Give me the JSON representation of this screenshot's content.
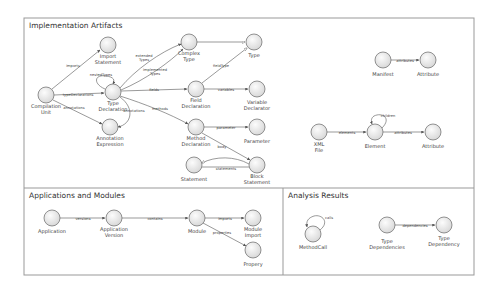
{
  "panels": [
    {
      "id": "impl",
      "title": "Implementation Artifacts",
      "x": 24,
      "y": 18,
      "w": 450,
      "h": 170
    },
    {
      "id": "apps",
      "title": "Applications and Modules",
      "x": 24,
      "y": 188,
      "w": 259,
      "h": 87
    },
    {
      "id": "analysis",
      "title": "Analysis Results",
      "x": 283,
      "y": 188,
      "w": 191,
      "h": 87
    }
  ],
  "nodes": [
    {
      "id": "cu",
      "label": [
        "Compilation",
        "Unit"
      ],
      "x": 46,
      "y": 95
    },
    {
      "id": "is",
      "label": [
        "Import",
        "Statement"
      ],
      "x": 108,
      "y": 45
    },
    {
      "id": "td",
      "label": [
        "Type",
        "Declaration"
      ],
      "x": 113,
      "y": 92
    },
    {
      "id": "ae",
      "label": [
        "Annotation",
        "Expression"
      ],
      "x": 110,
      "y": 127
    },
    {
      "id": "ct",
      "label": [
        "Complex",
        "Type"
      ],
      "x": 189,
      "y": 42
    },
    {
      "id": "ty",
      "label": [
        "Type"
      ],
      "x": 254,
      "y": 42
    },
    {
      "id": "fd",
      "label": [
        "Field",
        "Declaration"
      ],
      "x": 196,
      "y": 89
    },
    {
      "id": "vd",
      "label": [
        "Variable",
        "Declarator"
      ],
      "x": 257,
      "y": 89
    },
    {
      "id": "md",
      "label": [
        "Method",
        "Declaration"
      ],
      "x": 196,
      "y": 127
    },
    {
      "id": "pa",
      "label": [
        "Parameter"
      ],
      "x": 257,
      "y": 127
    },
    {
      "id": "st",
      "label": [
        "Statement"
      ],
      "x": 194,
      "y": 165
    },
    {
      "id": "bs",
      "label": [
        "Block",
        "Statement"
      ],
      "x": 257,
      "y": 165
    },
    {
      "id": "mf",
      "label": [
        "Manifest"
      ],
      "x": 383,
      "y": 60
    },
    {
      "id": "at1",
      "label": [
        "Attribute"
      ],
      "x": 428,
      "y": 60
    },
    {
      "id": "xf",
      "label": [
        "XML",
        "File"
      ],
      "x": 319,
      "y": 132
    },
    {
      "id": "el",
      "label": [
        "Element"
      ],
      "x": 375,
      "y": 132
    },
    {
      "id": "at2",
      "label": [
        "Attribute"
      ],
      "x": 433,
      "y": 132
    },
    {
      "id": "ap",
      "label": [
        "Application"
      ],
      "x": 52,
      "y": 218
    },
    {
      "id": "av",
      "label": [
        "Application",
        "Version"
      ],
      "x": 114,
      "y": 218
    },
    {
      "id": "mo",
      "label": [
        "Module"
      ],
      "x": 197,
      "y": 218
    },
    {
      "id": "mi",
      "label": [
        "Module",
        "Import"
      ],
      "x": 253,
      "y": 218
    },
    {
      "id": "pr",
      "label": [
        "Propery"
      ],
      "x": 253,
      "y": 250
    },
    {
      "id": "mc",
      "label": [
        "MethodCall"
      ],
      "x": 313,
      "y": 234
    },
    {
      "id": "tds",
      "label": [
        "Type",
        "Dependencies"
      ],
      "x": 387,
      "y": 225
    },
    {
      "id": "tdy",
      "label": [
        "Type",
        "Dependency"
      ],
      "x": 444,
      "y": 225
    }
  ],
  "edges": [
    {
      "from": "cu",
      "to": "is",
      "label": "imports"
    },
    {
      "from": "cu",
      "to": "td",
      "label": "typeDeclarations"
    },
    {
      "from": "cu",
      "to": "ae",
      "label": "annotations"
    },
    {
      "from": "td",
      "to": "td",
      "label": "nestedTypes",
      "self": true
    },
    {
      "from": "td",
      "to": "ct",
      "label": "extended Types"
    },
    {
      "from": "td",
      "to": "ct",
      "label": "Implemented Types"
    },
    {
      "from": "td",
      "to": "fd",
      "label": "fields"
    },
    {
      "from": "td",
      "to": "md",
      "label": "methods"
    },
    {
      "from": "td",
      "to": "ae",
      "label": "annotations"
    },
    {
      "from": "ct",
      "to": "ty",
      "label": ""
    },
    {
      "from": "fd",
      "to": "ty",
      "label": "fieldType"
    },
    {
      "from": "fd",
      "to": "vd",
      "label": "variables"
    },
    {
      "from": "md",
      "to": "pa",
      "label": "parameter"
    },
    {
      "from": "md",
      "to": "bs",
      "label": "body"
    },
    {
      "from": "bs",
      "to": "st",
      "label": "statements"
    },
    {
      "from": "mf",
      "to": "at1",
      "label": "attributes"
    },
    {
      "from": "xf",
      "to": "el",
      "label": "elements"
    },
    {
      "from": "el",
      "to": "el",
      "label": "children",
      "self": true
    },
    {
      "from": "el",
      "to": "at2",
      "label": "attributes"
    },
    {
      "from": "ap",
      "to": "av",
      "label": "versions"
    },
    {
      "from": "av",
      "to": "mo",
      "label": "contains"
    },
    {
      "from": "mo",
      "to": "mi",
      "label": "imports"
    },
    {
      "from": "mo",
      "to": "pr",
      "label": "properties"
    },
    {
      "from": "mc",
      "to": "mc",
      "label": "calls",
      "self": true
    },
    {
      "from": "tds",
      "to": "tdy",
      "label": "dependencies"
    }
  ],
  "colors": {
    "node_fill_light": "#fbfbfb",
    "node_fill_dark": "#d8d8d8",
    "node_stroke": "#666666",
    "panel_border": "#999999"
  }
}
